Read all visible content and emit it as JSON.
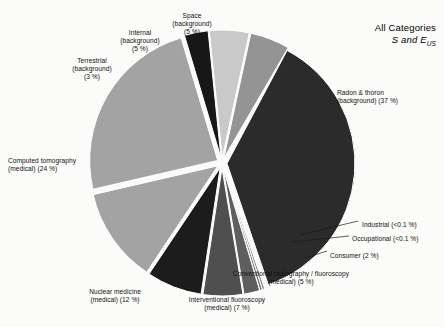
{
  "title": {
    "line1": "All Categories",
    "line2_main": "S",
    "line2_and": " and ",
    "line2_e": "E",
    "line2_sub": "US"
  },
  "chart_data": {
    "type": "pie",
    "total_percent": 100,
    "legend": "none",
    "categories": [
      "Radon & thoron (background)",
      "Industrial",
      "Occupational",
      "Consumer",
      "Conventional radiography / fluoroscopy (medical)",
      "Interventional fluoroscopy (medical)",
      "Nuclear medicine (medical)",
      "Computed tomography (medical)",
      "Terrestrial (background)",
      "Internal (background)",
      "Space (background)"
    ],
    "values": [
      37,
      0.1,
      0.1,
      2,
      5,
      7,
      12,
      24,
      3,
      5,
      5
    ],
    "value_labels": [
      "37 %",
      "<0.1 %",
      "<0.1 %",
      "2 %",
      "5 %",
      "7 %",
      "12 %",
      "24 %",
      "3 %",
      "5 %",
      "5 %"
    ],
    "colors": [
      "#2b2b2b",
      "#8c8c8c",
      "#6f6f6f",
      "#5e5e5e",
      "#4f4f4f",
      "#1c1c1c",
      "#a3a3a3",
      "#a3a3a3",
      "#171717",
      "#c9c9c9",
      "#949494"
    ],
    "slices": [
      {
        "id": "radon-thoron",
        "label_lines": [
          "Radon & thoron",
          "(background) (37 %)"
        ],
        "percent": 37,
        "percent_label": "37 %",
        "color": "#2b2b2b",
        "start_deg": -62,
        "sweep_deg": 133.2,
        "label_x": 337,
        "label_y": 89,
        "label_align": "l"
      },
      {
        "id": "industrial",
        "label_lines": [
          "Industrial (<0.1 %)"
        ],
        "percent": 0.1,
        "percent_label": "<0.1 %",
        "color": "#8c8c8c",
        "start_deg": 71.2,
        "sweep_deg": 1.1,
        "label_x": 362,
        "label_y": 221,
        "label_align": "l"
      },
      {
        "id": "occupational",
        "label_lines": [
          "Occupational (<0.1 %)"
        ],
        "percent": 0.1,
        "percent_label": "<0.1 %",
        "color": "#6f6f6f",
        "start_deg": 72.3,
        "sweep_deg": 1.1,
        "label_x": 352,
        "label_y": 235,
        "label_align": "l"
      },
      {
        "id": "consumer",
        "label_lines": [
          "Consumer (2 %)"
        ],
        "percent": 2,
        "percent_label": "2 %",
        "color": "#5e5e5e",
        "start_deg": 73.4,
        "sweep_deg": 7.2,
        "label_x": 330,
        "label_y": 252,
        "label_align": "l"
      },
      {
        "id": "conventional-radiography",
        "label_lines": [
          "Conventional radiography / fluoroscopy",
          "(medical) (5 %)"
        ],
        "percent": 5,
        "percent_label": "5 %",
        "color": "#4f4f4f",
        "start_deg": 80.6,
        "sweep_deg": 18,
        "label_x": 291,
        "label_y": 270,
        "label_align": "c"
      },
      {
        "id": "interventional-fluoroscopy",
        "label_lines": [
          "Interventional fluoroscopy",
          "(medical) (7 %)"
        ],
        "percent": 7,
        "percent_label": "7 %",
        "color": "#1c1c1c",
        "start_deg": 98.6,
        "sweep_deg": 25.2,
        "label_x": 227,
        "label_y": 296,
        "label_align": "c"
      },
      {
        "id": "nuclear-medicine",
        "label_lines": [
          "Nuclear medicine",
          "(medical) (12 %)",
          ""
        ],
        "percent": 12,
        "percent_label": "12 %",
        "color": "#a3a3a3",
        "start_deg": 123.8,
        "sweep_deg": 43.2,
        "label_x": 115,
        "label_y": 288,
        "label_align": "c"
      },
      {
        "id": "computed-tomography",
        "label_lines": [
          "Computed tomography",
          "(medical) (24 %)"
        ],
        "percent": 24,
        "percent_label": "24 %",
        "color": "#a3a3a3",
        "start_deg": 167,
        "sweep_deg": 86.4,
        "label_x": 8,
        "label_y": 157,
        "label_align": "l"
      },
      {
        "id": "terrestrial",
        "label_lines": [
          "Terrestrial",
          "(background)",
          "(3 %)"
        ],
        "percent": 3,
        "percent_label": "3 %",
        "color": "#171717",
        "start_deg": 253.4,
        "sweep_deg": 10.8,
        "label_x": 92,
        "label_y": 57,
        "label_align": "c"
      },
      {
        "id": "internal",
        "label_lines": [
          "Internal",
          "(background)",
          "(5 %)"
        ],
        "percent": 5,
        "percent_label": "5 %",
        "color": "#c9c9c9",
        "start_deg": 264.2,
        "sweep_deg": 18,
        "label_x": 140,
        "label_y": 29,
        "label_align": "c"
      },
      {
        "id": "space",
        "label_lines": [
          "Space",
          "(background)",
          "(5 %)"
        ],
        "percent": 5,
        "percent_label": "5 %",
        "color": "#949494",
        "start_deg": 282.2,
        "sweep_deg": 18,
        "label_x": 192,
        "label_y": 12,
        "label_align": "c"
      }
    ],
    "leader_lines": [
      {
        "id": "industrial-leader",
        "x1": 300,
        "y1": 235,
        "x2": 358,
        "y2": 221
      },
      {
        "id": "occupational-leader",
        "x1": 292,
        "y1": 242,
        "x2": 349,
        "y2": 236
      },
      {
        "id": "consumer-leader",
        "x1": 305,
        "y1": 258,
        "x2": 327,
        "y2": 251
      }
    ],
    "geometry": {
      "cx": 222,
      "cy": 163,
      "radius": 128,
      "explode": 5
    }
  }
}
